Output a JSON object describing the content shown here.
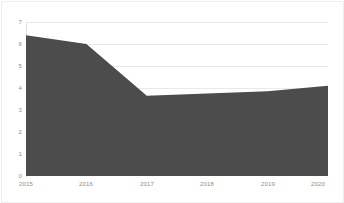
{
  "chart_data": {
    "type": "area",
    "title": "",
    "subtitle": "",
    "xlabel": "",
    "ylabel": "",
    "categories": [
      "2015",
      "2016",
      "2017",
      "2018",
      "2019",
      "2020"
    ],
    "x": [
      2015,
      2016,
      2017,
      2018,
      2019,
      2020
    ],
    "values": [
      6.4,
      6.0,
      3.65,
      3.75,
      3.85,
      4.1
    ],
    "series": [
      {
        "name": "",
        "values": [
          6.4,
          6.0,
          3.65,
          3.75,
          3.85,
          4.1
        ]
      }
    ],
    "ylim": [
      0,
      7
    ],
    "xlim": [
      2015,
      2020
    ],
    "yticks": [
      0,
      1,
      2,
      3,
      4,
      5,
      6,
      7
    ],
    "ytick_labels": [
      "0",
      "1",
      "2",
      "3",
      "4",
      "5",
      "6",
      "7"
    ],
    "xtick_labels": [
      "2015",
      "2016",
      "2017",
      "2018",
      "2019",
      "2020"
    ],
    "grid": true,
    "grid_axis": "y",
    "legend": false,
    "legend_position": "none",
    "annotations": [],
    "colors": {
      "area_fill": "#4c4c4c",
      "grid": "#e9e9e9",
      "axis": "#d2d2d2",
      "tick_label": "#8c8c8c",
      "background": "#ffffff",
      "frame": "#efefef"
    }
  }
}
